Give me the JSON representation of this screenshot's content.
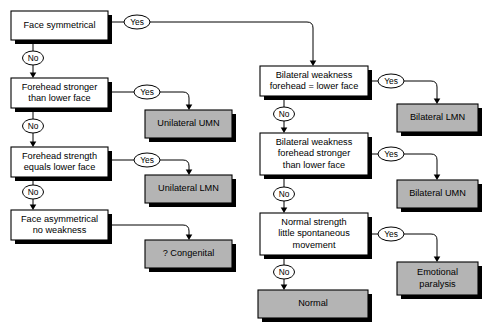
{
  "diagram": {
    "colors": {
      "background": "#ffffff",
      "decision_fill": "#ffffff",
      "terminal_fill": "#b4b4b4",
      "stroke": "#000000",
      "shadow": "#000000"
    },
    "nodes": [
      {
        "id": "face-symmetrical",
        "kind": "decision",
        "lines": [
          "Face symmetrical"
        ],
        "x": 11,
        "y": 11,
        "w": 97,
        "h": 29
      },
      {
        "id": "forehead-stronger-than-lower-face",
        "kind": "decision",
        "lines": [
          "Forehead stronger",
          "than lower face"
        ],
        "x": 11,
        "y": 78,
        "w": 97,
        "h": 30
      },
      {
        "id": "forehead-strength-equals-lower-face",
        "kind": "decision",
        "lines": [
          "Forehead strength",
          "equals lower face"
        ],
        "x": 11,
        "y": 147,
        "w": 97,
        "h": 30
      },
      {
        "id": "face-asymmetrical-no-weakness",
        "kind": "decision",
        "lines": [
          "Face asymmetrical",
          "no weakness"
        ],
        "x": 11,
        "y": 210,
        "w": 97,
        "h": 30
      },
      {
        "id": "unilateral-umn",
        "kind": "terminal",
        "lines": [
          "Unilateral UMN"
        ],
        "x": 145,
        "y": 110,
        "w": 87,
        "h": 28
      },
      {
        "id": "unilateral-lmn",
        "kind": "terminal",
        "lines": [
          "Unilateral LMN"
        ],
        "x": 145,
        "y": 175,
        "w": 87,
        "h": 28
      },
      {
        "id": "congenital",
        "kind": "terminal",
        "lines": [
          "? Congenital"
        ],
        "x": 145,
        "y": 240,
        "w": 87,
        "h": 28
      },
      {
        "id": "bilateral-weakness-forehead-equals-lower-face",
        "kind": "decision",
        "lines": [
          "Bilateral weakness",
          "forehead = lower face"
        ],
        "x": 260,
        "y": 66,
        "w": 108,
        "h": 30
      },
      {
        "id": "bilateral-weakness-forehead-stronger",
        "kind": "decision",
        "lines": [
          "Bilateral weakness",
          "forehead stronger",
          "than lower face"
        ],
        "x": 260,
        "y": 133,
        "w": 108,
        "h": 42
      },
      {
        "id": "normal-strength-little-spontaneous-movement",
        "kind": "decision",
        "lines": [
          "Normal strength",
          "little spontaneous",
          "movement"
        ],
        "x": 260,
        "y": 213,
        "w": 108,
        "h": 42
      },
      {
        "id": "normal",
        "kind": "terminal",
        "lines": [
          "Normal"
        ],
        "x": 258,
        "y": 290,
        "w": 110,
        "h": 28
      },
      {
        "id": "bilateral-lmn",
        "kind": "terminal",
        "lines": [
          "Bilateral LMN"
        ],
        "x": 397,
        "y": 104,
        "w": 81,
        "h": 28
      },
      {
        "id": "bilateral-umn",
        "kind": "terminal",
        "lines": [
          "Bilateral UMN"
        ],
        "x": 397,
        "y": 180,
        "w": 81,
        "h": 28
      },
      {
        "id": "emotional-paralysis",
        "kind": "terminal",
        "lines": [
          "Emotional",
          "paralysis"
        ],
        "x": 397,
        "y": 262,
        "w": 81,
        "h": 33
      }
    ],
    "edges": [
      {
        "id": "face-symmetrical-yes",
        "from": "face-symmetrical",
        "to": "bilateral-weakness-forehead-equals-lower-face",
        "label": "Yes",
        "label_cx": 137,
        "label_cy": 22,
        "path": "M 112 22 L 124 22 M 150 22 L 307 22 Q 313 22 313 28 L 313 62",
        "arrow": {
          "x": 313,
          "y": 66
        }
      },
      {
        "id": "face-symmetrical-no",
        "from": "face-symmetrical",
        "to": "forehead-stronger-than-lower-face",
        "label": "No",
        "label_cx": 33,
        "label_cy": 58,
        "path": "M 33 43 L 33 51 M 33 65 L 33 74",
        "arrow": {
          "x": 33,
          "y": 78
        }
      },
      {
        "id": "forehead-stronger-yes",
        "from": "forehead-stronger-than-lower-face",
        "to": "unilateral-umn",
        "label": "Yes",
        "label_cx": 147,
        "label_cy": 92,
        "path": "M 112 92 L 134 92 M 160 92 L 183 92 Q 189 92 189 98 L 189 106",
        "arrow": {
          "x": 189,
          "y": 110
        }
      },
      {
        "id": "forehead-stronger-no",
        "from": "forehead-stronger-than-lower-face",
        "to": "forehead-strength-equals-lower-face",
        "label": "No",
        "label_cx": 33,
        "label_cy": 126,
        "path": "M 33 111 L 33 119 M 33 133 L 33 143",
        "arrow": {
          "x": 33,
          "y": 147
        }
      },
      {
        "id": "forehead-strength-equals-yes",
        "from": "forehead-strength-equals-lower-face",
        "to": "unilateral-lmn",
        "label": "Yes",
        "label_cx": 147,
        "label_cy": 160,
        "path": "M 112 160 L 134 160 M 160 160 L 183 160 Q 189 160 189 166 L 189 171",
        "arrow": {
          "x": 189,
          "y": 175
        }
      },
      {
        "id": "forehead-strength-equals-no",
        "from": "forehead-strength-equals-lower-face",
        "to": "face-asymmetrical-no-weakness",
        "label": "No",
        "label_cx": 33,
        "label_cy": 192,
        "path": "M 33 180 L 33 185 M 33 199 L 33 206",
        "arrow": {
          "x": 33,
          "y": 210
        }
      },
      {
        "id": "face-asymmetrical-to-congenital",
        "from": "face-asymmetrical-no-weakness",
        "to": "congenital",
        "label": "",
        "label_cx": 0,
        "label_cy": 0,
        "path": "M 112 225 L 183 225 Q 189 225 189 231 L 189 236",
        "arrow": {
          "x": 189,
          "y": 240
        }
      },
      {
        "id": "bilateral-equals-yes",
        "from": "bilateral-weakness-forehead-equals-lower-face",
        "to": "bilateral-lmn",
        "label": "Yes",
        "label_cx": 391,
        "label_cy": 81,
        "path": "M 372 81 L 378 81 M 404 81 L 431 81 Q 437 81 437 87 L 437 100",
        "arrow": {
          "x": 437,
          "y": 104
        }
      },
      {
        "id": "bilateral-equals-no",
        "from": "bilateral-weakness-forehead-equals-lower-face",
        "to": "bilateral-weakness-forehead-stronger",
        "label": "No",
        "label_cx": 284,
        "label_cy": 114,
        "path": "M 284 99 L 284 107 M 284 121 L 284 129",
        "arrow": {
          "x": 284,
          "y": 133
        }
      },
      {
        "id": "bilateral-stronger-yes",
        "from": "bilateral-weakness-forehead-stronger",
        "to": "bilateral-umn",
        "label": "Yes",
        "label_cx": 391,
        "label_cy": 154,
        "path": "M 372 154 L 378 154 M 404 154 L 431 154 Q 437 154 437 160 L 437 176",
        "arrow": {
          "x": 437,
          "y": 180
        }
      },
      {
        "id": "bilateral-stronger-no",
        "from": "bilateral-weakness-forehead-stronger",
        "to": "normal-strength-little-spontaneous-movement",
        "label": "No",
        "label_cx": 284,
        "label_cy": 194,
        "path": "M 284 178 L 284 187 M 284 201 L 284 209",
        "arrow": {
          "x": 284,
          "y": 213
        }
      },
      {
        "id": "normal-strength-yes",
        "from": "normal-strength-little-spontaneous-movement",
        "to": "emotional-paralysis",
        "label": "Yes",
        "label_cx": 391,
        "label_cy": 234,
        "path": "M 372 234 L 378 234 M 404 234 L 431 234 Q 437 234 437 240 L 437 258",
        "arrow": {
          "x": 437,
          "y": 262
        }
      },
      {
        "id": "normal-strength-no",
        "from": "normal-strength-little-spontaneous-movement",
        "to": "normal",
        "label": "No",
        "label_cx": 284,
        "label_cy": 272,
        "path": "M 284 258 L 284 265 M 284 279 L 284 286",
        "arrow": {
          "x": 284,
          "y": 290
        }
      }
    ]
  }
}
